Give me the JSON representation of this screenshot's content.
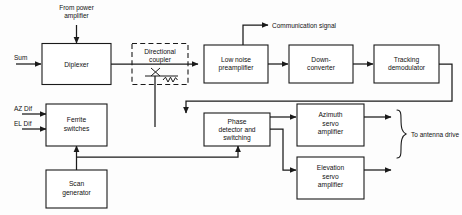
{
  "diagram": {
    "colors": {
      "line": "#1a1a1a",
      "background": "#fdfdfd",
      "block_fill": "#ffffff"
    },
    "blocks": [
      {
        "id": "diplexer",
        "label": "Diplexer",
        "lines": [
          "Diplexer"
        ],
        "style": "solid"
      },
      {
        "id": "coupler",
        "label": "Directional coupler",
        "lines": [
          "Directional",
          "coupler"
        ],
        "style": "dashed"
      },
      {
        "id": "lnp",
        "label": "Low noise preamplifier",
        "lines": [
          "Low noise",
          "preamplifier"
        ],
        "style": "solid"
      },
      {
        "id": "downconv",
        "label": "Down-converter",
        "lines": [
          "Down-",
          "converter"
        ],
        "style": "solid"
      },
      {
        "id": "trackdemod",
        "label": "Tracking demodulator",
        "lines": [
          "Tracking",
          "demodulator"
        ],
        "style": "solid"
      },
      {
        "id": "ferrite",
        "label": "Ferrite switches",
        "lines": [
          "Ferrite",
          "switches"
        ],
        "style": "solid"
      },
      {
        "id": "scangen",
        "label": "Scan generator",
        "lines": [
          "Scan",
          "generator"
        ],
        "style": "solid"
      },
      {
        "id": "phasedet",
        "label": "Phase detector and switching",
        "lines": [
          "Phase",
          "detector and",
          "switching"
        ],
        "style": "solid"
      },
      {
        "id": "azservo",
        "label": "Azimuth servo amplifier",
        "lines": [
          "Azimuth",
          "servo",
          "amplifier"
        ],
        "style": "solid"
      },
      {
        "id": "elservo",
        "label": "Elevation servo amplifier",
        "lines": [
          "Elevation",
          "servo",
          "amplifier"
        ],
        "style": "solid"
      }
    ],
    "annotations": [
      {
        "id": "from-power-amplifier",
        "lines": [
          "From power",
          "amplifier"
        ],
        "label": "From power amplifier"
      },
      {
        "id": "sum-input",
        "lines": [
          "Sum"
        ],
        "label": "Sum"
      },
      {
        "id": "az-dif-input",
        "lines": [
          "AZ Dif"
        ],
        "label": "AZ Dif"
      },
      {
        "id": "el-dif-input",
        "lines": [
          "EL Dif"
        ],
        "label": "EL Dif"
      },
      {
        "id": "communication-signal",
        "lines": [
          "Communication signal"
        ],
        "label": "Communication signal"
      },
      {
        "id": "to-antenna-drive",
        "lines": [
          "To antenna drive"
        ],
        "label": "To antenna drive"
      }
    ],
    "text": {
      "diplexer": "Diplexer",
      "coupler_l1": "Directional",
      "coupler_l2": "coupler",
      "lnp_l1": "Low noise",
      "lnp_l2": "preamplifier",
      "downconv_l1": "Down-",
      "downconv_l2": "converter",
      "trackdemod_l1": "Tracking",
      "trackdemod_l2": "demodulator",
      "ferrite_l1": "Ferrite",
      "ferrite_l2": "switches",
      "scangen_l1": "Scan",
      "scangen_l2": "generator",
      "phasedet_l1": "Phase",
      "phasedet_l2": "detector and",
      "phasedet_l3": "switching",
      "azservo_l1": "Azimuth",
      "azservo_l2": "servo",
      "azservo_l3": "amplifier",
      "elservo_l1": "Elevation",
      "elservo_l2": "servo",
      "elservo_l3": "amplifier",
      "from_power_l1": "From power",
      "from_power_l2": "amplifier",
      "sum": "Sum",
      "az_dif": "AZ Dif",
      "el_dif": "EL Dif",
      "communication_signal": "Communication signal",
      "to_antenna_drive": "To antenna drive"
    }
  }
}
